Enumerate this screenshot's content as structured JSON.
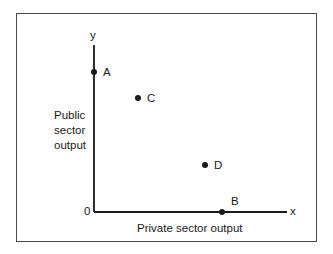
{
  "diagram": {
    "type": "production-possibility-points",
    "axes": {
      "x_label": "x",
      "y_label": "y",
      "origin_label": "0",
      "x_title": "Private sector output",
      "y_title_lines": [
        "Public",
        "sector",
        "output"
      ]
    },
    "points": [
      {
        "label": "A",
        "description": "on y-axis, high public output, zero private output"
      },
      {
        "label": "C",
        "description": "high public, low private output"
      },
      {
        "label": "D",
        "description": "low public, high private output"
      },
      {
        "label": "B",
        "description": "on x-axis, zero public output"
      }
    ],
    "colors": {
      "ink": "#1a1a1a",
      "frame": "#4a4a4a",
      "background": "#ffffff"
    }
  }
}
